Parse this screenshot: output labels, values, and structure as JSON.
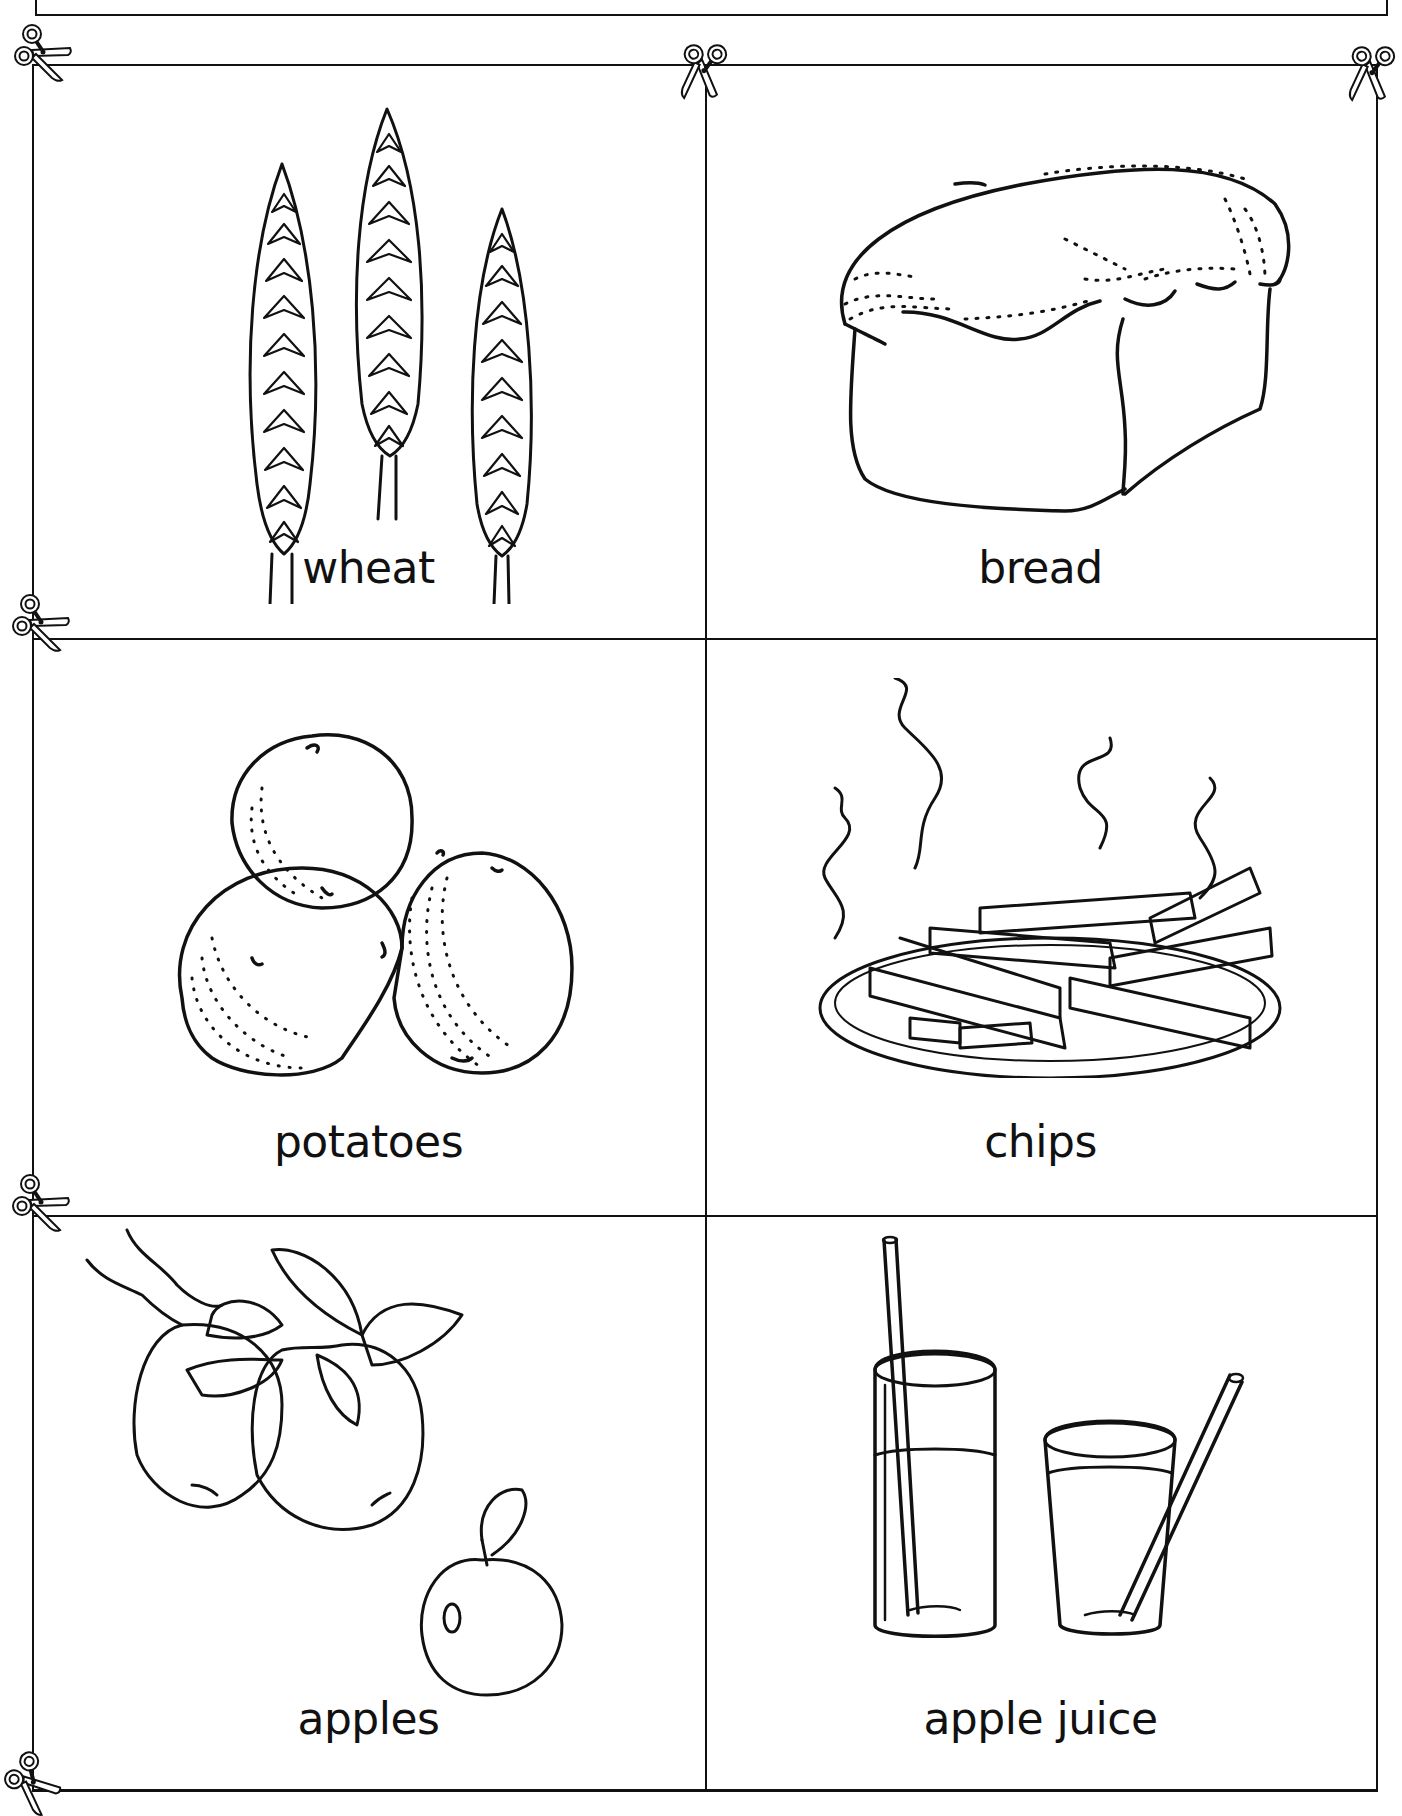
{
  "worksheet": {
    "cards": [
      {
        "id": "wheat",
        "label": "wheat",
        "image": "wheat-illustration"
      },
      {
        "id": "bread",
        "label": "bread",
        "image": "bread-loaf-illustration"
      },
      {
        "id": "potatoes",
        "label": "potatoes",
        "image": "potatoes-illustration"
      },
      {
        "id": "chips",
        "label": "chips",
        "image": "chips-on-plate-illustration"
      },
      {
        "id": "apples",
        "label": "apples",
        "image": "apples-on-branch-illustration"
      },
      {
        "id": "apple-juice",
        "label": "apple juice",
        "image": "glasses-of-juice-illustration"
      }
    ],
    "cut_markers": [
      "scissors-icon",
      "scissors-icon",
      "scissors-icon",
      "scissors-icon",
      "scissors-icon",
      "scissors-icon"
    ],
    "colors": {
      "line": "#111111",
      "background": "#ffffff"
    }
  }
}
